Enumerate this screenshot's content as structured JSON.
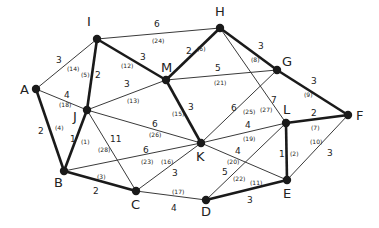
{
  "graph": {
    "nodes": [
      {
        "id": "I",
        "x": 97,
        "y": 39,
        "lx": 87,
        "ly": 26
      },
      {
        "id": "H",
        "x": 220,
        "y": 28,
        "lx": 215,
        "ly": 16
      },
      {
        "id": "M",
        "x": 166,
        "y": 80,
        "lx": 161,
        "ly": 72
      },
      {
        "id": "G",
        "x": 277,
        "y": 70,
        "lx": 282,
        "ly": 66
      },
      {
        "id": "A",
        "x": 36,
        "y": 89,
        "lx": 20,
        "ly": 94
      },
      {
        "id": "J",
        "x": 87,
        "y": 110,
        "lx": 73,
        "ly": 121
      },
      {
        "id": "F",
        "x": 348,
        "y": 115,
        "lx": 356,
        "ly": 120
      },
      {
        "id": "L",
        "x": 286,
        "y": 123,
        "lx": 283,
        "ly": 114
      },
      {
        "id": "K",
        "x": 201,
        "y": 143,
        "lx": 196,
        "ly": 161
      },
      {
        "id": "B",
        "x": 64,
        "y": 171,
        "lx": 54,
        "ly": 187
      },
      {
        "id": "E",
        "x": 287,
        "y": 180,
        "lx": 283,
        "ly": 198
      },
      {
        "id": "C",
        "x": 136,
        "y": 191,
        "lx": 131,
        "ly": 209
      },
      {
        "id": "D",
        "x": 206,
        "y": 200,
        "lx": 201,
        "ly": 216
      }
    ],
    "edges": [
      {
        "from": "I",
        "to": "H",
        "weight": "6",
        "order": "(24)",
        "bold": false,
        "wx": 154,
        "wy": 27,
        "ox": 152,
        "oy": 43
      },
      {
        "from": "I",
        "to": "M",
        "weight": "3",
        "order": "(12)",
        "bold": true,
        "wx": 140,
        "wy": 60,
        "ox": 121,
        "oy": 68
      },
      {
        "from": "I",
        "to": "A",
        "weight": "3",
        "order": "(14)",
        "bold": false,
        "wx": 56,
        "wy": 63,
        "ox": 67,
        "oy": 71
      },
      {
        "from": "I",
        "to": "J",
        "weight": "2",
        "order": "(5)",
        "bold": true,
        "wx": 95,
        "wy": 78,
        "ox": 81,
        "oy": 77
      },
      {
        "from": "H",
        "to": "M",
        "weight": "2",
        "order": "(6)",
        "bold": true,
        "wx": 186,
        "wy": 54,
        "ox": 197,
        "oy": 51
      },
      {
        "from": "H",
        "to": "G",
        "weight": "3",
        "order": "(8)",
        "bold": true,
        "wx": 258,
        "wy": 49,
        "ox": 251,
        "oy": 62
      },
      {
        "from": "H",
        "to": "L",
        "weight": "7",
        "order": "(27)",
        "bold": false,
        "wx": 271,
        "wy": 103,
        "ox": 260,
        "oy": 112
      },
      {
        "from": "M",
        "to": "G",
        "weight": "5",
        "order": "(21)",
        "bold": false,
        "wx": 215,
        "wy": 71,
        "ox": 214,
        "oy": 85
      },
      {
        "from": "M",
        "to": "J",
        "weight": "3",
        "order": "(13)",
        "bold": false,
        "wx": 124,
        "wy": 87,
        "ox": 127,
        "oy": 103
      },
      {
        "from": "M",
        "to": "K",
        "weight": "3",
        "order": "(15)",
        "bold": true,
        "wx": 188,
        "wy": 110,
        "ox": 172,
        "oy": 116
      },
      {
        "from": "G",
        "to": "F",
        "weight": "3",
        "order": "(9)",
        "bold": true,
        "wx": 311,
        "wy": 84,
        "ox": 304,
        "oy": 97
      },
      {
        "from": "G",
        "to": "K",
        "weight": "6",
        "order": "(25)",
        "bold": false,
        "wx": 231,
        "wy": 111,
        "ox": 243,
        "oy": 114
      },
      {
        "from": "A",
        "to": "J",
        "weight": "4",
        "order": "(18)",
        "bold": false,
        "wx": 64,
        "wy": 98,
        "ox": 59,
        "oy": 107
      },
      {
        "from": "A",
        "to": "B",
        "weight": "2",
        "order": "(4)",
        "bold": true,
        "wx": 38,
        "wy": 134,
        "ox": 55,
        "oy": 130
      },
      {
        "from": "J",
        "to": "B",
        "weight": "1",
        "order": "(1)",
        "bold": true,
        "wx": 70,
        "wy": 142,
        "ox": 81,
        "oy": 144
      },
      {
        "from": "J",
        "to": "K",
        "weight": "6",
        "order": "(26)",
        "bold": false,
        "wx": 152,
        "wy": 127,
        "ox": 149,
        "oy": 137
      },
      {
        "from": "J",
        "to": "C",
        "weight": "11",
        "order": "(28)",
        "bold": false,
        "wx": 110,
        "wy": 142,
        "ox": 98,
        "oy": 152
      },
      {
        "from": "B",
        "to": "K",
        "weight": "6",
        "order": "(23)",
        "bold": false,
        "wx": 143,
        "wy": 153,
        "ox": 141,
        "oy": 164
      },
      {
        "from": "B",
        "to": "C",
        "weight": "2",
        "order": "(3)",
        "bold": true,
        "wx": 93,
        "wy": 194,
        "ox": 97,
        "oy": 179
      },
      {
        "from": "C",
        "to": "K",
        "weight": "3",
        "order": "(16)",
        "bold": false,
        "wx": 172,
        "wy": 176,
        "ox": 161,
        "oy": 164
      },
      {
        "from": "C",
        "to": "D",
        "weight": "4",
        "order": "(17)",
        "bold": false,
        "wx": 171,
        "wy": 211,
        "ox": 172,
        "oy": 194
      },
      {
        "from": "K",
        "to": "L",
        "weight": "4",
        "order": "(19)",
        "bold": false,
        "wx": 245,
        "wy": 128,
        "ox": 243,
        "oy": 141
      },
      {
        "from": "K",
        "to": "E",
        "weight": "4",
        "order": "(20)",
        "bold": false,
        "wx": 235,
        "wy": 154,
        "ox": 227,
        "oy": 164
      },
      {
        "from": "L",
        "to": "D",
        "weight": "5",
        "order": "(22)",
        "bold": false,
        "wx": 222,
        "wy": 175,
        "ox": 233,
        "oy": 181
      },
      {
        "from": "L",
        "to": "F",
        "weight": "2",
        "order": "(7)",
        "bold": true,
        "wx": 311,
        "wy": 116,
        "ox": 311,
        "oy": 130
      },
      {
        "from": "L",
        "to": "E",
        "weight": "1",
        "order": "(2)",
        "bold": true,
        "wx": 279,
        "wy": 157,
        "ox": 290,
        "oy": 156
      },
      {
        "from": "F",
        "to": "E",
        "weight": "3",
        "order": "(10)",
        "bold": false,
        "wx": 327,
        "wy": 156,
        "ox": 310,
        "oy": 144
      },
      {
        "from": "D",
        "to": "E",
        "weight": "3",
        "order": "(11)",
        "bold": true,
        "wx": 247,
        "wy": 203,
        "ox": 250,
        "oy": 185
      }
    ]
  }
}
